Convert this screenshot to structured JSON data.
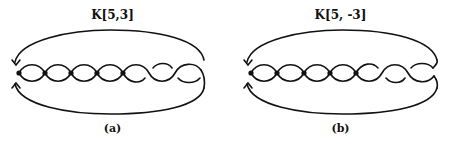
{
  "figure": {
    "panels": [
      {
        "id": "a",
        "title": "K[5,3]",
        "caption": "(a)",
        "dotted_crossings": 5,
        "plain_crossings": 3
      },
      {
        "id": "b",
        "title": "K[5, -3]",
        "caption": "(b)",
        "dotted_crossings": 5,
        "plain_crossings": 3
      }
    ],
    "colors": {
      "line": "#111111",
      "background": "#ffffff"
    }
  }
}
